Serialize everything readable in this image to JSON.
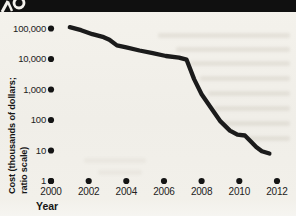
{
  "chart_data": {
    "type": "line",
    "title": "",
    "x_axis_label": "Year",
    "y_axis_label": "Cost (thousands of dollars;\nratio scale)",
    "y_scale": "log",
    "x_range": [
      2000,
      2012
    ],
    "y_range": [
      1,
      100000
    ],
    "grid": false,
    "legend": false,
    "x_ticks": [
      2000,
      2002,
      2004,
      2006,
      2008,
      2010,
      2012
    ],
    "x_tick_labels": [
      "2000",
      "2002",
      "2004",
      "2006",
      "2008",
      "2010",
      "2012"
    ],
    "y_ticks": [
      1,
      10,
      100,
      1000,
      10000,
      100000
    ],
    "y_tick_labels": [
      "1",
      "10",
      "100",
      "1,000",
      "10,000",
      "100,000"
    ],
    "series": [
      {
        "name": "cost",
        "points": [
          [
            2001.0,
            110000
          ],
          [
            2001.6,
            88000
          ],
          [
            2002.2,
            65000
          ],
          [
            2002.8,
            52000
          ],
          [
            2003.1,
            43000
          ],
          [
            2003.5,
            28000
          ],
          [
            2004.0,
            24000
          ],
          [
            2004.7,
            19000
          ],
          [
            2005.4,
            15500
          ],
          [
            2006.1,
            12500
          ],
          [
            2006.8,
            11000
          ],
          [
            2007.2,
            9500
          ],
          [
            2007.6,
            2200
          ],
          [
            2008.0,
            700
          ],
          [
            2008.5,
            250
          ],
          [
            2009.0,
            90
          ],
          [
            2009.5,
            45
          ],
          [
            2009.9,
            33
          ],
          [
            2010.3,
            31
          ],
          [
            2010.6,
            20
          ],
          [
            2010.9,
            13
          ],
          [
            2011.2,
            9.5
          ],
          [
            2011.6,
            8
          ]
        ]
      }
    ]
  }
}
